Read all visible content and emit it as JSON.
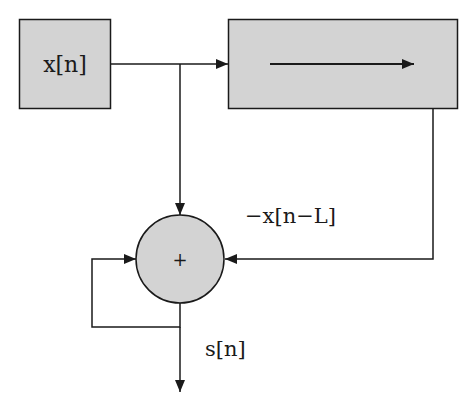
{
  "diagram": {
    "type": "block-diagram",
    "colors": {
      "block_fill": "#d3d3d3",
      "stroke": "#1a1a1a",
      "background": "#ffffff"
    },
    "nodes": [
      {
        "id": "input",
        "label": "x[n]",
        "shape": "rectangle"
      },
      {
        "id": "delay",
        "label": "",
        "shape": "rectangle",
        "content": "right-arrow"
      },
      {
        "id": "adder",
        "label": "+",
        "shape": "circle"
      }
    ],
    "edges": [
      {
        "from": "input",
        "to": "delay"
      },
      {
        "from": "input",
        "to": "adder"
      },
      {
        "from": "delay",
        "to": "adder",
        "label": "−x[n−L]"
      },
      {
        "from": "adder",
        "to": "adder",
        "kind": "feedback"
      },
      {
        "from": "adder",
        "to": "output",
        "label": "s[n]"
      }
    ],
    "labels": {
      "input": "x[n]",
      "adder": "+",
      "delayed_input": "−x[n−L]",
      "output": "s[n]"
    }
  }
}
